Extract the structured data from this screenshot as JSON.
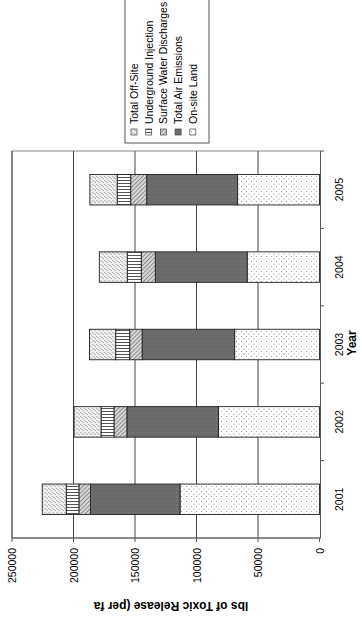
{
  "chart_data": {
    "type": "bar",
    "stacked": true,
    "orientation": "rotated-90-clockwise",
    "title": "",
    "xlabel": "Year",
    "ylabel": "lbs of Toxic Release (per fa",
    "categories": [
      "2001",
      "2002",
      "2003",
      "2004",
      "2005"
    ],
    "series": [
      {
        "name": "On-site Land",
        "pattern": "dots",
        "values": [
          113400,
          82200,
          69000,
          58800,
          66600
        ]
      },
      {
        "name": "Total Air Emissions",
        "pattern": "dark-solid",
        "values": [
          72800,
          74400,
          75200,
          74700,
          73900
        ]
      },
      {
        "name": "Surface Water Discharges",
        "pattern": "diagonal-hatch",
        "values": [
          9400,
          10500,
          10100,
          11400,
          13000
        ]
      },
      {
        "name": "Underground Injection",
        "pattern": "horizontal-lines",
        "values": [
          10300,
          10500,
          11400,
          11400,
          11000
        ]
      },
      {
        "name": "Total Off-Site",
        "pattern": "dashed-vertical",
        "values": [
          19500,
          21900,
          21300,
          22700,
          22200
        ]
      }
    ],
    "ylim": [
      0,
      250000
    ],
    "yticks": [
      "0",
      "50000",
      "100000",
      "150000",
      "200000",
      "250000"
    ],
    "grid": true,
    "legend_position": "top (rotated right)",
    "legend_entries": [
      "Total Off-Site",
      "Underground Injection",
      "Surface Water Discharges",
      "Total Air Emissions",
      "On-site Land"
    ]
  }
}
